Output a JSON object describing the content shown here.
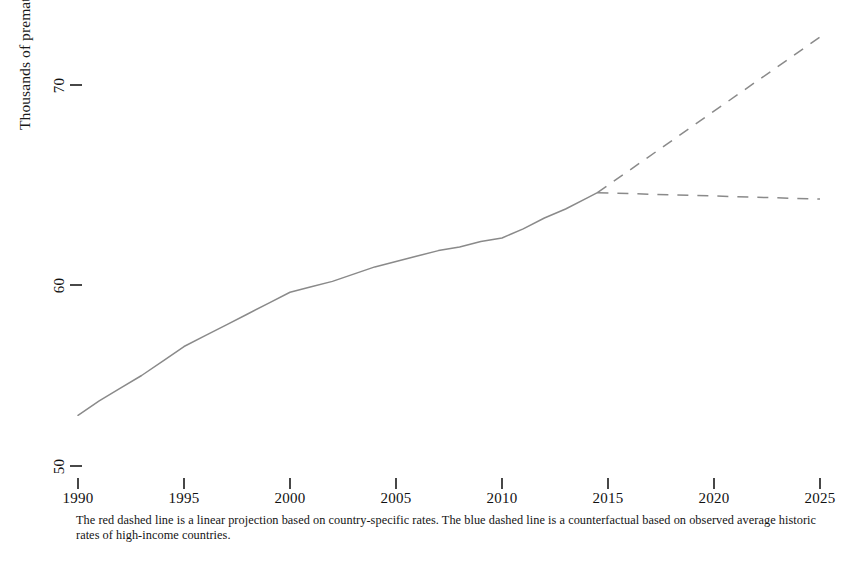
{
  "chart_data": {
    "type": "line",
    "title": "",
    "subtitle": "",
    "xlabel": "",
    "ylabel": "Thousands of premature deaths",
    "xlim": [
      1990,
      2025
    ],
    "ylim": [
      48.5,
      74.5
    ],
    "xticks": [
      1990,
      1995,
      2000,
      2005,
      2010,
      2015,
      2020,
      2025
    ],
    "xtick_labels": [
      "1990",
      "1995",
      "2000",
      "2005",
      "2010",
      "2015",
      "2020",
      "2025"
    ],
    "yticks": [
      50,
      60,
      70
    ],
    "ytick_labels": [
      "50",
      "60",
      "70"
    ],
    "grid": false,
    "legend": "none",
    "caption": "The red dashed line is a linear projection based on country-specific rates. The blue dashed line is a counterfactual based on observed average historic rates of high-income countries.",
    "series": [
      {
        "name": "Observed premature deaths",
        "style": "solid",
        "color": "#8a8a8a",
        "x": [
          1990,
          1991,
          1992,
          1993,
          1994,
          1995,
          1996,
          1997,
          1998,
          1999,
          2000,
          2001,
          2002,
          2003,
          2004,
          2005,
          2006,
          2007,
          2008,
          2009,
          2010,
          2011,
          2012,
          2013,
          2014,
          2014.5
        ],
        "values": [
          52.8,
          53.6,
          54.3,
          55.0,
          55.8,
          56.6,
          57.2,
          57.8,
          58.4,
          59.0,
          59.6,
          59.9,
          60.2,
          60.6,
          61.0,
          61.3,
          61.6,
          61.9,
          62.1,
          62.4,
          62.6,
          63.1,
          63.7,
          64.2,
          64.8,
          65.1
        ]
      },
      {
        "name": "Linear projection based on country-specific rates",
        "style": "dashed",
        "color": "#8a8a8a",
        "x": [
          2014.5,
          2025
        ],
        "values": [
          65.1,
          73.7
        ]
      },
      {
        "name": "Counterfactual based on observed average historic rates of high-income countries",
        "style": "dashed",
        "color": "#8a8a8a",
        "x": [
          2014.5,
          2025
        ],
        "values": [
          65.1,
          64.75
        ]
      }
    ]
  },
  "axis": {
    "ylabel_title": "Thousands of premature deaths",
    "ytick_70": "70",
    "ytick_60": "60",
    "ytick_50": "50",
    "xtick_1990": "1990",
    "xtick_1995": "1995",
    "xtick_2000": "2000",
    "xtick_2005": "2005",
    "xtick_2010": "2010",
    "xtick_2015": "2015",
    "xtick_2020": "2020",
    "xtick_2025": "2025"
  },
  "footnote": {
    "text": "The red dashed line is a linear projection based on country-specific rates. The blue dashed line is a counterfactual based on observed average historic rates of high-income countries."
  }
}
